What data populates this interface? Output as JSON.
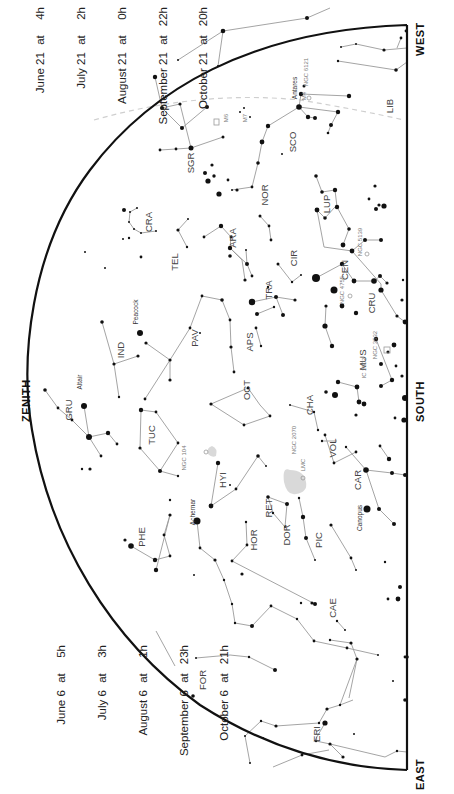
{
  "directions": {
    "west": "WEST",
    "south": "SOUTH",
    "east": "EAST",
    "zenith": "ZENITH"
  },
  "dates_top": [
    {
      "date": "June 21",
      "at": "at",
      "time": "4h"
    },
    {
      "date": "July 21",
      "at": "at",
      "time": "2h"
    },
    {
      "date": "August 21",
      "at": "at",
      "time": "0h"
    },
    {
      "date": "September 21",
      "at": "at",
      "time": "22h"
    },
    {
      "date": "October 21",
      "at": "at",
      "time": "20h"
    }
  ],
  "dates_bottom": [
    {
      "date": "June 6",
      "at": "at",
      "time": "5h"
    },
    {
      "date": "July 6",
      "at": "at",
      "time": "3h"
    },
    {
      "date": "August 6",
      "at": "at",
      "time": "1h"
    },
    {
      "date": "September 6",
      "at": "at",
      "time": "23h"
    },
    {
      "date": "October 6",
      "at": "at",
      "time": "21h"
    }
  ],
  "constellations": [
    {
      "abbr": "LIB",
      "x": 393,
      "y": 106
    },
    {
      "abbr": "SCO",
      "x": 296,
      "y": 142
    },
    {
      "abbr": "SGR",
      "x": 194,
      "y": 163
    },
    {
      "abbr": "CRA",
      "x": 152,
      "y": 222
    },
    {
      "abbr": "TEL",
      "x": 178,
      "y": 262
    },
    {
      "abbr": "ARA",
      "x": 236,
      "y": 238
    },
    {
      "abbr": "NOR",
      "x": 268,
      "y": 195
    },
    {
      "abbr": "LUP",
      "x": 330,
      "y": 204
    },
    {
      "abbr": "CIR",
      "x": 297,
      "y": 258
    },
    {
      "abbr": "CEN",
      "x": 348,
      "y": 270
    },
    {
      "abbr": "TRA",
      "x": 272,
      "y": 290
    },
    {
      "abbr": "APS",
      "x": 253,
      "y": 342
    },
    {
      "abbr": "PAV",
      "x": 198,
      "y": 338
    },
    {
      "abbr": "IND",
      "x": 124,
      "y": 350
    },
    {
      "abbr": "GRU",
      "x": 72,
      "y": 410
    },
    {
      "abbr": "TUC",
      "x": 155,
      "y": 435
    },
    {
      "abbr": "OCT",
      "x": 250,
      "y": 390
    },
    {
      "abbr": "MUS",
      "x": 366,
      "y": 360
    },
    {
      "abbr": "CRU",
      "x": 375,
      "y": 303
    },
    {
      "abbr": "CHA",
      "x": 313,
      "y": 405
    },
    {
      "abbr": "VOL",
      "x": 336,
      "y": 448
    },
    {
      "abbr": "HYI",
      "x": 226,
      "y": 480
    },
    {
      "abbr": "RET",
      "x": 272,
      "y": 508
    },
    {
      "abbr": "DOR",
      "x": 290,
      "y": 535
    },
    {
      "abbr": "PIC",
      "x": 322,
      "y": 540
    },
    {
      "abbr": "CAR",
      "x": 361,
      "y": 480
    },
    {
      "abbr": "PHE",
      "x": 145,
      "y": 537
    },
    {
      "abbr": "HOR",
      "x": 257,
      "y": 540
    },
    {
      "abbr": "CAE",
      "x": 336,
      "y": 608
    },
    {
      "abbr": "FOR",
      "x": 206,
      "y": 680
    },
    {
      "abbr": "ERI",
      "x": 320,
      "y": 734
    }
  ],
  "named_stars": [
    {
      "name": "Antares",
      "x": 297,
      "y": 88
    },
    {
      "name": "Peacock",
      "x": 138,
      "y": 312
    },
    {
      "name": "Altair",
      "x": 82,
      "y": 382
    },
    {
      "name": "Achernar",
      "x": 195,
      "y": 512
    },
    {
      "name": "Canopus",
      "x": 362,
      "y": 518
    }
  ],
  "deep_sky": [
    {
      "label": "M6",
      "x": 228,
      "y": 118
    },
    {
      "label": "M7",
      "x": 247,
      "y": 118
    },
    {
      "label": "M4",
      "x": 306,
      "y": 96
    },
    {
      "label": "NGC 6121",
      "x": 308,
      "y": 72
    },
    {
      "label": "NGC 5139",
      "x": 362,
      "y": 242
    },
    {
      "label": "NGC 4755",
      "x": 344,
      "y": 290
    },
    {
      "label": "NGC 3532",
      "x": 377,
      "y": 345
    },
    {
      "label": "IC 2602",
      "x": 366,
      "y": 368
    },
    {
      "label": "NGC 104",
      "x": 186,
      "y": 458
    },
    {
      "label": "NGC 2070",
      "x": 296,
      "y": 440
    },
    {
      "label": "LMC",
      "x": 305,
      "y": 465
    }
  ],
  "colors": {
    "horizon": "#111111",
    "lines": "#9a9a9a",
    "ecliptic": "#cccccc",
    "stars": "#111111",
    "text": "#444444",
    "magellanic": "#d6d6d6"
  }
}
